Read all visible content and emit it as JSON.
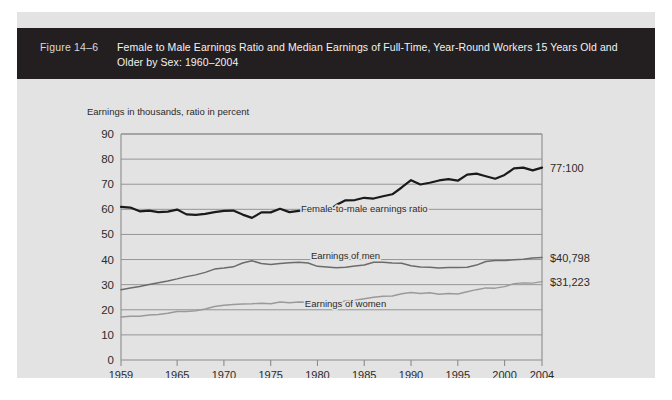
{
  "figure": {
    "number": "Figure 14–6",
    "title": "Female to Male Earnings Ratio and Median Earnings of Full-Time, Year-Round Workers 15 Years Old and Older by Sex: 1960–2004"
  },
  "axis_caption": "Earnings in thousands, ratio in percent",
  "annotations": {
    "ratio": "77:100",
    "men": "$40,798",
    "women": "$31,223"
  },
  "series_labels": {
    "ratio": "Female-to-male earnings ratio",
    "men": "Earnings of men",
    "women": "Earnings of women"
  },
  "colors": {
    "header_bg": "#231f20",
    "panel_bg": "#e3e3e3",
    "ratio_line": "#1a1a1a",
    "men_line": "#6b6b6b",
    "women_line": "#9a9a9a",
    "grid": "#8c8c8c",
    "text": "#2b2b2b"
  },
  "chart_data": {
    "type": "line",
    "title": "Female to Male Earnings Ratio and Median Earnings of Full-Time, Year-Round Workers 15 Years Old and Older by Sex: 1960–2004",
    "xlabel": "",
    "ylabel": "Earnings in thousands, ratio in percent",
    "xlim": [
      1959,
      2004
    ],
    "ylim": [
      0,
      90
    ],
    "yticks": [
      0,
      10,
      20,
      30,
      40,
      50,
      60,
      70,
      80,
      90
    ],
    "xticks": [
      1959,
      1965,
      1970,
      1975,
      1980,
      1985,
      1990,
      1995,
      2000,
      2004
    ],
    "grid": true,
    "legend": "inline-labels",
    "x": [
      1959,
      1960,
      1961,
      1962,
      1963,
      1964,
      1965,
      1966,
      1967,
      1968,
      1969,
      1970,
      1971,
      1972,
      1973,
      1974,
      1975,
      1976,
      1977,
      1978,
      1979,
      1980,
      1981,
      1982,
      1983,
      1984,
      1985,
      1986,
      1987,
      1988,
      1989,
      1990,
      1991,
      1992,
      1993,
      1994,
      1995,
      1996,
      1997,
      1998,
      1999,
      2000,
      2001,
      2002,
      2003,
      2004
    ],
    "series": [
      {
        "name": "Female-to-male earnings ratio",
        "unit": "percent",
        "end_value_label": "77:100",
        "values": [
          61.0,
          60.7,
          59.2,
          59.5,
          58.9,
          59.1,
          59.9,
          58.0,
          57.8,
          58.2,
          58.9,
          59.4,
          59.5,
          57.9,
          56.6,
          58.8,
          58.8,
          60.2,
          58.9,
          59.4,
          59.7,
          60.2,
          59.2,
          61.7,
          63.6,
          63.7,
          64.6,
          64.3,
          65.2,
          66.0,
          68.7,
          71.6,
          69.9,
          70.6,
          71.5,
          72.0,
          71.4,
          73.8,
          74.2,
          73.2,
          72.2,
          73.7,
          76.3,
          76.6,
          75.5,
          76.6
        ]
      },
      {
        "name": "Earnings of men",
        "unit": "thousands of dollars",
        "end_value_label": "$40,798",
        "values": [
          28.0,
          28.7,
          29.3,
          30.1,
          30.8,
          31.5,
          32.3,
          33.2,
          33.9,
          34.9,
          36.2,
          36.6,
          37.1,
          38.6,
          39.5,
          38.4,
          38.0,
          38.4,
          38.7,
          38.9,
          38.6,
          37.3,
          37.0,
          36.7,
          36.9,
          37.4,
          37.8,
          38.9,
          38.9,
          38.6,
          38.5,
          37.5,
          37.0,
          36.9,
          36.6,
          36.8,
          36.8,
          36.9,
          37.8,
          39.2,
          39.6,
          39.6,
          39.9,
          40.1,
          40.6,
          40.8
        ]
      },
      {
        "name": "Earnings of women",
        "unit": "thousands of dollars",
        "end_value_label": "$31,223",
        "values": [
          17.1,
          17.4,
          17.4,
          17.9,
          18.1,
          18.6,
          19.3,
          19.3,
          19.6,
          20.3,
          21.3,
          21.8,
          22.1,
          22.3,
          22.4,
          22.6,
          22.4,
          23.1,
          22.8,
          23.1,
          23.0,
          22.5,
          21.9,
          22.6,
          23.5,
          23.8,
          24.4,
          25.0,
          25.4,
          25.5,
          26.4,
          26.9,
          26.5,
          26.8,
          26.2,
          26.5,
          26.3,
          27.2,
          28.0,
          28.7,
          28.6,
          29.2,
          30.4,
          30.7,
          30.6,
          31.2
        ]
      }
    ]
  }
}
